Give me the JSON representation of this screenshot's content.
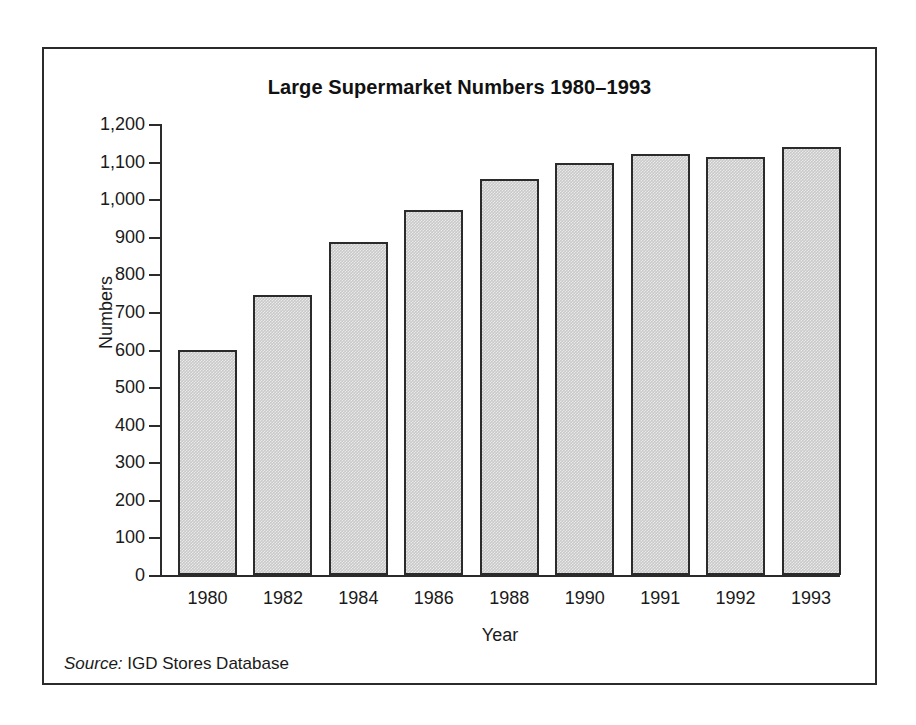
{
  "chart_data": {
    "type": "bar",
    "title": "Large Supermarket Numbers 1980–1993",
    "xlabel": "Year",
    "ylabel": "Numbers",
    "categories": [
      "1980",
      "1982",
      "1984",
      "1986",
      "1988",
      "1990",
      "1991",
      "1992",
      "1993"
    ],
    "values": [
      600,
      745,
      885,
      970,
      1055,
      1095,
      1120,
      1113,
      1140
    ],
    "ylim": [
      0,
      1200
    ],
    "ytick_values": [
      0,
      100,
      200,
      300,
      400,
      500,
      600,
      700,
      800,
      900,
      1000,
      1100,
      1200
    ],
    "ytick_labels": [
      "0",
      "100",
      "200",
      "300",
      "400",
      "500",
      "600",
      "700",
      "800",
      "900",
      "1,000",
      "1,100",
      "1,200"
    ],
    "grid": false,
    "legend": null,
    "bar_fill_color": "#c9c9c9",
    "bar_edge_color": "#2b2b2b"
  },
  "source": {
    "label": "Source:",
    "text": " IGD Stores Database"
  }
}
